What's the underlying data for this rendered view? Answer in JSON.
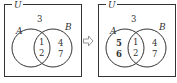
{
  "diagrams": [
    {
      "universe_label": "U",
      "set_a_label": "A",
      "set_b_label": "B",
      "outside": [
        "3"
      ],
      "a_only": [],
      "intersection": [
        "1",
        "2"
      ],
      "b_only": [
        "4",
        "7"
      ]
    },
    {
      "universe_label": "U",
      "set_a_label": "A",
      "set_b_label": "B",
      "outside": [
        "3"
      ],
      "a_only": [
        "5",
        "6"
      ],
      "intersection": [
        "1",
        "2"
      ],
      "b_only": [
        "4",
        "7"
      ]
    }
  ],
  "arrow": "⇨",
  "colors": {
    "stroke": "#333333",
    "arrow": "#888888",
    "background": "#ffffff"
  }
}
